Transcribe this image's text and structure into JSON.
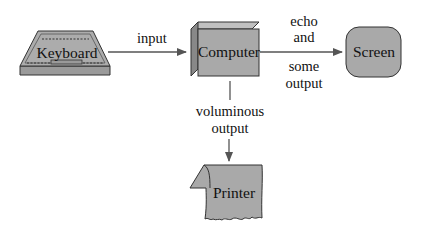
{
  "nodes": {
    "keyboard": {
      "label": "Keyboard",
      "icon": "keyboard-icon"
    },
    "computer": {
      "label": "Computer",
      "icon": "box-3d-icon"
    },
    "screen": {
      "label": "Screen",
      "icon": "rounded-screen-icon"
    },
    "printer": {
      "label": "Printer",
      "icon": "paper-sheet-icon"
    }
  },
  "edges": {
    "input": {
      "from": "keyboard",
      "to": "computer",
      "label": "input"
    },
    "echo": {
      "from": "computer",
      "to": "screen",
      "label_top_1": "echo",
      "label_top_2": "and",
      "label_bottom_1": "some",
      "label_bottom_2": "output"
    },
    "voluminous": {
      "from": "computer",
      "to": "printer",
      "label_1": "voluminous",
      "label_2": "output"
    }
  },
  "colors": {
    "fill": "#a9a9a9",
    "fill_dark": "#8c8c8c",
    "fill_light": "#c4c4c4",
    "stroke": "#333333",
    "arrow": "#555555",
    "background": "#ffffff"
  }
}
